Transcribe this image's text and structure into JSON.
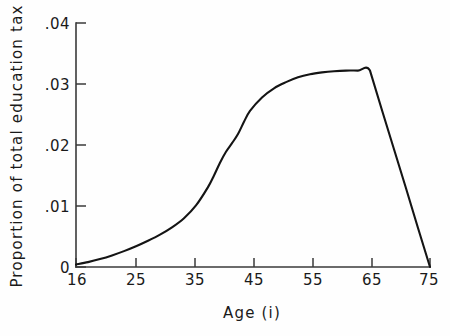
{
  "chart_data": {
    "type": "line",
    "title": "",
    "xlabel": "Age (i)",
    "ylabel": "Proportion of total education tax",
    "xlim": [
      16,
      75
    ],
    "ylim": [
      0,
      0.04
    ],
    "grid": false,
    "legend": "none",
    "xticks": [
      16,
      25,
      35,
      45,
      55,
      65,
      75
    ],
    "xtick_labels": [
      "16",
      "25",
      "35",
      "45",
      "55",
      "65",
      "75"
    ],
    "yticks": [
      0,
      0.01,
      0.02,
      0.03,
      0.04
    ],
    "ytick_labels": [
      "0",
      ".01",
      ".02",
      ".03",
      ".04"
    ],
    "series": [
      {
        "name": "Proportion of total education tax",
        "x": [
          16,
          18,
          20,
          22,
          24,
          26,
          28,
          30,
          32,
          34,
          36,
          38,
          39,
          40,
          41,
          42,
          43,
          44,
          45,
          47,
          49,
          51,
          53,
          55,
          57,
          59,
          61,
          63,
          65,
          67,
          69,
          71,
          73,
          75
        ],
        "y": [
          0.0004,
          0.0008,
          0.0013,
          0.0019,
          0.0026,
          0.0034,
          0.0043,
          0.0053,
          0.0065,
          0.008,
          0.0101,
          0.0131,
          0.015,
          0.0171,
          0.0189,
          0.0203,
          0.0218,
          0.0238,
          0.0256,
          0.0278,
          0.0293,
          0.0303,
          0.0311,
          0.0316,
          0.0319,
          0.0321,
          0.0322,
          0.0322,
          0.0322,
          0.0257,
          0.0193,
          0.0129,
          0.0064,
          0.0
        ]
      }
    ],
    "annotations": [
      "curve rises slowly from age 16, steep inflection near ages 39-45",
      "plateau at approximately 0.0322 between ages 60 and 65",
      "linear decline from age 65 to zero at age 75"
    ]
  },
  "axis": {
    "y_label": "Proportion of total education tax",
    "x_label": "Age (i)"
  },
  "colors": {
    "curve": "#141414",
    "axis": "#3a3a3a",
    "background": "#fefefe",
    "text": "#1a1a1a"
  }
}
